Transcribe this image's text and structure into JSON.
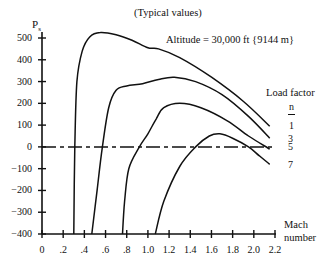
{
  "chart_data": {
    "type": "line",
    "title": "(Typical values)",
    "annotation": "Altitude = 30,000 ft {9144 m}",
    "xlabel": "Mach number",
    "ylabel": "Ps",
    "ylabel_main": "P",
    "ylabel_sub": "s",
    "xlim": [
      0,
      2.2
    ],
    "ylim": [
      -400,
      500
    ],
    "x_ticks": [
      "0",
      ".2",
      ".4",
      ".6",
      ".8",
      "1.0",
      "1.2",
      "1.4",
      "1.6",
      "1.8",
      "2.0",
      "2.2"
    ],
    "y_ticks": [
      "500",
      "400",
      "300",
      "200",
      "100",
      "0",
      "-100",
      "-200",
      "-300",
      "-400"
    ],
    "grid": false,
    "legend": {
      "title": "Load factor",
      "subtitle": "n",
      "position": "right",
      "entries": [
        "1",
        "3",
        "5",
        "7"
      ]
    },
    "reference_line": {
      "y": 0,
      "style": "dash-dot"
    },
    "series": [
      {
        "name": "n = 1",
        "points": [
          [
            0.3,
            -400
          ],
          [
            0.31,
            0
          ],
          [
            0.33,
            300
          ],
          [
            0.38,
            440
          ],
          [
            0.45,
            505
          ],
          [
            0.55,
            525
          ],
          [
            0.7,
            515
          ],
          [
            0.85,
            490
          ],
          [
            1.0,
            455
          ],
          [
            1.1,
            450
          ],
          [
            1.3,
            410
          ],
          [
            1.6,
            320
          ],
          [
            1.9,
            210
          ],
          [
            2.15,
            95
          ]
        ]
      },
      {
        "name": "n = 3",
        "points": [
          [
            0.47,
            -400
          ],
          [
            0.52,
            -200
          ],
          [
            0.57,
            0
          ],
          [
            0.63,
            180
          ],
          [
            0.7,
            260
          ],
          [
            0.8,
            280
          ],
          [
            0.95,
            290
          ],
          [
            1.1,
            310
          ],
          [
            1.25,
            320
          ],
          [
            1.45,
            300
          ],
          [
            1.7,
            240
          ],
          [
            1.95,
            140
          ],
          [
            2.15,
            40
          ]
        ]
      },
      {
        "name": "n = 5",
        "points": [
          [
            0.76,
            -400
          ],
          [
            0.78,
            -250
          ],
          [
            0.82,
            -100
          ],
          [
            0.92,
            0
          ],
          [
            1.0,
            60
          ],
          [
            1.08,
            130
          ],
          [
            1.15,
            180
          ],
          [
            1.3,
            200
          ],
          [
            1.5,
            180
          ],
          [
            1.75,
            120
          ],
          [
            1.95,
            50
          ],
          [
            2.15,
            -10
          ]
        ]
      },
      {
        "name": "n = 7",
        "points": [
          [
            1.07,
            -400
          ],
          [
            1.15,
            -250
          ],
          [
            1.3,
            -90
          ],
          [
            1.45,
            0
          ],
          [
            1.58,
            50
          ],
          [
            1.68,
            60
          ],
          [
            1.8,
            40
          ],
          [
            1.95,
            0
          ],
          [
            2.05,
            -40
          ],
          [
            2.15,
            -80
          ]
        ]
      }
    ]
  }
}
